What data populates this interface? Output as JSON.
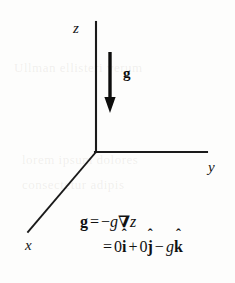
{
  "figure": {
    "background_color": "#fdfdfc",
    "ink_color": "#111111",
    "axes": {
      "origin": [
        96,
        152
      ],
      "z": {
        "label": "z",
        "tip": [
          96,
          22
        ]
      },
      "y": {
        "label": "y",
        "tip": [
          207,
          152
        ]
      },
      "x": {
        "label": "x",
        "tip": [
          28,
          232
        ]
      }
    },
    "vector": {
      "label": "g",
      "direction": "down",
      "shaft_top": [
        110,
        52
      ],
      "tip": [
        110,
        112
      ]
    },
    "equation": {
      "line1": {
        "lhs": "g",
        "equals": "=",
        "minus": "−",
        "g": "g",
        "nabla": "∇",
        "z": "z"
      },
      "line2": {
        "equals": "=",
        "zero_i": "0",
        "i": "i",
        "plus": "+",
        "zero_j": "0",
        "j": "j",
        "minus": "−",
        "g": "g",
        "k": "k",
        "hat": "ˆ"
      }
    }
  }
}
